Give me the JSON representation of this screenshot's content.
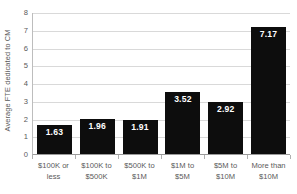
{
  "chart_data": {
    "type": "bar",
    "title": "",
    "xlabel": "",
    "ylabel": "Average FTE dedicated to CM",
    "categories": [
      "$100K or less",
      "$100K to $500K",
      "$500K to $1M",
      "$1M to $5M",
      "$5M to $10M",
      "More than $10M"
    ],
    "category_lines": [
      [
        "$100K or",
        "less"
      ],
      [
        "$100K to",
        "$500K"
      ],
      [
        "$500K to",
        "$1M"
      ],
      [
        "$1M to",
        "$5M"
      ],
      [
        "$5M to",
        "$10M"
      ],
      [
        "More than",
        "$10M"
      ]
    ],
    "values": [
      1.63,
      1.96,
      1.91,
      3.52,
      2.92,
      7.17
    ],
    "value_labels": [
      "1.63",
      "1.96",
      "1.91",
      "3.52",
      "2.92",
      "7.17"
    ],
    "ylim": [
      0,
      8
    ],
    "yticks": [
      0,
      1,
      2,
      3,
      4,
      5,
      6,
      7,
      8
    ],
    "ytick_labels": [
      "0",
      "1",
      "2",
      "3",
      "4",
      "5",
      "6",
      "7",
      "8"
    ],
    "grid": true,
    "legend": null,
    "bar_color": "#0d0d0d",
    "label_color": "#ffffff",
    "gridline_color": "#d9d9d9",
    "axis_text_color": "#595959"
  }
}
